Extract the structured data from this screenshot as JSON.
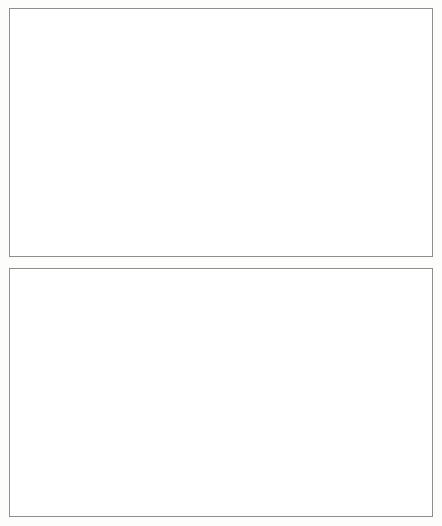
{
  "figure": {
    "name": "two-panel-line-chart-figure",
    "panels": 2
  },
  "chart_data": [
    {
      "id": "top",
      "type": "line",
      "title": "",
      "subtitle": "",
      "xlabel": "",
      "ylabel": "",
      "xlim": [
        1990,
        2007
      ],
      "ylim": [
        0,
        50
      ],
      "ytick_labels": [
        "0",
        "10",
        "20",
        "30",
        "40",
        "50"
      ],
      "ytick_values": [
        0,
        10,
        20,
        30,
        40,
        50
      ],
      "xtick_labels": [
        "1990",
        "1992",
        "1994",
        "1996",
        "1998",
        "2000",
        "2002",
        "2004",
        "2006"
      ],
      "xtick_values": [
        1990,
        1992,
        1994,
        1996,
        1998,
        2000,
        2002,
        2004,
        2006
      ],
      "minor_xticks": [
        1991,
        1993,
        1995,
        1997,
        1999,
        2001,
        2003,
        2005,
        2007
      ],
      "grid": false,
      "legend_position": "upper-left-inside",
      "x": [
        1990,
        1991,
        1992,
        1993,
        1994,
        1995,
        1996,
        1997,
        1998,
        1999,
        2000,
        2001,
        2002,
        2003,
        2004,
        2005,
        2006,
        2007
      ],
      "series": [
        {
          "name": "Emerging Asia excl. China",
          "color": "#767676",
          "style": "solid",
          "width": 2.2,
          "values": [
            20.6,
            21.3,
            21.0,
            21.5,
            22.2,
            21.2,
            21.0,
            19.7,
            25.0,
            24.9,
            24.4,
            26.2,
            28.6,
            31.8,
            35.0,
            32.6,
            33.2,
            34.3
          ]
        },
        {
          "name": "China",
          "color": "#111111",
          "style": "dashed",
          "width": 3.0,
          "values": [
            9.9,
            11.8,
            8.8,
            4.5,
            9.0,
            10.0,
            11.2,
            12.9,
            12.5,
            10.9,
            10.7,
            11.2,
            12.3,
            14.7,
            18.8,
            25.0,
            28.3,
            31.5
          ]
        },
        {
          "name": "Latin America",
          "color": "#111111",
          "style": "solid",
          "width": 1.5,
          "values": [
            15.5,
            17.1,
            17.1,
            15.2,
            15.0,
            25.3,
            28.4,
            24.4,
            22.5,
            22.0,
            22.5,
            23.0,
            24.0,
            29.0,
            29.0,
            27.0,
            28.0,
            33.7
          ]
        },
        {
          "name": "Other Em. Markets",
          "color": "#b3b3b3",
          "style": "dashed",
          "width": 2.2,
          "values": [
            9.6,
            10.4,
            12.3,
            13.5,
            15.5,
            20.5,
            21.0,
            20.7,
            21.0,
            20.2,
            20.8,
            21.2,
            21.8,
            24.3,
            29.4,
            32.3,
            36.0,
            38.3
          ]
        }
      ]
    },
    {
      "id": "bottom",
      "type": "line",
      "title": "",
      "subtitle": "",
      "xlabel": "",
      "ylabel": "",
      "xlim": [
        1990,
        2007
      ],
      "ylim": [
        0,
        100
      ],
      "ytick_labels": [
        "0",
        "20",
        "40",
        "60",
        "80",
        "100"
      ],
      "ytick_values": [
        0,
        20,
        40,
        60,
        80,
        100
      ],
      "xtick_labels": [
        "1990",
        "1992",
        "1994",
        "1996",
        "1998",
        "2000",
        "2002",
        "2004",
        "2006"
      ],
      "xtick_values": [
        1990,
        1992,
        1994,
        1996,
        1998,
        2000,
        2002,
        2004,
        2006
      ],
      "minor_xticks": [
        1991,
        1993,
        1995,
        1997,
        1999,
        2001,
        2003,
        2005,
        2007
      ],
      "grid": false,
      "legend_position": "center-left-inside-two-columns",
      "x": [
        1990,
        1991,
        1992,
        1993,
        1994,
        1995,
        1996,
        1997,
        1998,
        1999,
        2000,
        2001,
        2002,
        2003,
        2004,
        2005,
        2006,
        2007
      ],
      "series": [
        {
          "name": "Hong Kong SAR",
          "color": "#111111",
          "style": "dashed",
          "width": 1.6,
          "values": [
            9.0,
            23.0,
            27.5,
            29.5,
            27.5,
            24.5,
            30.0,
            20.0,
            35.5,
            38.5,
            41.5,
            45.5,
            43.5,
            44.0,
            45.0,
            36.5,
            38.0,
            45.2
          ]
        },
        {
          "name": "India",
          "color": "#111111",
          "style": "dotted",
          "width": 1.8,
          "values": [
            1.8,
            2.2,
            3.8,
            5.2,
            9.0,
            11.5,
            12.0,
            11.5,
            13.0,
            13.5,
            14.5,
            15.0,
            18.0,
            21.5,
            25.5,
            26.0,
            26.5,
            27.0
          ]
        },
        {
          "name": "Indonesia",
          "color": "#111111",
          "style": "solid",
          "width": 2.4,
          "values": [
            15.0,
            19.5,
            18.0,
            17.0,
            16.0,
            15.0,
            17.5,
            14.0,
            40.5,
            32.5,
            34.0,
            34.5,
            33.0,
            31.5,
            31.0,
            28.0,
            28.0,
            31.5
          ]
        },
        {
          "name": "Korea",
          "color": "#c8c8c8",
          "style": "solid",
          "width": 1.8,
          "values": [
            18.5,
            14.5,
            13.0,
            14.0,
            15.5,
            16.5,
            17.5,
            12.0,
            23.5,
            24.5,
            25.0,
            25.5,
            27.5,
            31.0,
            42.0,
            40.0,
            41.5,
            42.0
          ]
        },
        {
          "name": "Malaysia",
          "color": "#8a8a8a",
          "style": "solid",
          "width": 1.2,
          "values": [
            18.5,
            19.5,
            23.0,
            29.0,
            30.0,
            25.0,
            21.0,
            19.5,
            25.5,
            27.0,
            25.5,
            24.5,
            27.0,
            31.5,
            36.0,
            38.0,
            40.0,
            43.5
          ]
        },
        {
          "name": "Philippines",
          "color": "#111111",
          "style": "dashed",
          "width": 2.6,
          "values": [
            15.0,
            16.0,
            17.5,
            18.5,
            19.0,
            19.0,
            19.5,
            16.5,
            22.5,
            23.0,
            23.5,
            24.5,
            25.0,
            25.0,
            24.0,
            22.5,
            21.0,
            21.0
          ]
        },
        {
          "name": "Singapore",
          "color": "#555555",
          "style": "dashdot",
          "width": 1.1,
          "values": [
            81.0,
            85.0,
            85.5,
            95.5,
            95.0,
            95.5,
            96.5,
            88.0,
            79.0,
            76.0,
            81.0,
            76.0,
            81.0,
            86.0,
            92.5,
            86.0,
            83.0,
            79.0
          ]
        },
        {
          "name": "Taiwan POC",
          "color": "#bdbdbd",
          "style": "dashdot",
          "width": 1.2,
          "values": [
            31.5,
            27.5,
            25.5,
            24.5,
            24.0,
            23.0,
            22.0,
            20.5,
            19.5,
            19.0,
            19.0,
            21.5,
            24.0,
            26.5,
            26.5,
            31.0,
            36.5,
            41.0
          ]
        },
        {
          "name": "Thailand",
          "color": "#d2d2d2",
          "style": "solid",
          "width": 2.6,
          "values": [
            19.0,
            18.5,
            16.5,
            16.5,
            17.5,
            19.0,
            19.0,
            10.5,
            28.0,
            26.0,
            27.0,
            27.0,
            28.0,
            30.5,
            33.0,
            33.0,
            36.5,
            39.5
          ]
        }
      ]
    }
  ],
  "top_panel": {
    "legend": [
      {
        "label": "Emerging Asia excl. China",
        "swatch": "thick-gray-solid"
      },
      {
        "label": "China",
        "swatch": "thick-black-dashed"
      },
      {
        "label": "Latin America",
        "swatch": "black-solid"
      },
      {
        "label": "Other Em. Markets",
        "swatch": "light-gray-dashed"
      }
    ]
  },
  "bottom_panel": {
    "legend_col1": [
      {
        "label": "Hong Kong SAR",
        "swatch": "black-dashed"
      },
      {
        "label": "Indonesia",
        "swatch": "thick-black-solid"
      },
      {
        "label": "Malaysia",
        "swatch": "gray-solid"
      },
      {
        "label": "Singapore",
        "swatch": "dark-dashdot"
      },
      {
        "label": "Thailand",
        "swatch": "light-gray-thick-solid"
      }
    ],
    "legend_col2": [
      {
        "label": "India",
        "swatch": "black-dotted"
      },
      {
        "label": "Korea",
        "swatch": "light-gray-solid"
      },
      {
        "label": "Philippines",
        "swatch": "thick-black-dashed"
      },
      {
        "label": "Taiwan POC",
        "swatch": "light-gray-dashdot"
      }
    ]
  }
}
